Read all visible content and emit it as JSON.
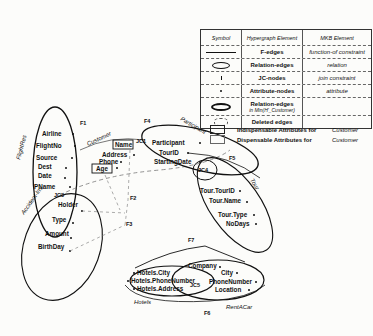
{
  "legend": {
    "headers": {
      "symbol": "Symbol",
      "hypergraph": "Hypergraph Element",
      "mkb": "MKB Element"
    },
    "rows": [
      {
        "symbol": "line-icon",
        "hypergraph": "F-edges",
        "mkb": "function-of constraint"
      },
      {
        "symbol": "ellipse-icon",
        "hypergraph": "Relation-edges",
        "mkb": "relation"
      },
      {
        "symbol": "tick-icon",
        "hypergraph": "JC-nodes",
        "mkb": "join constraint"
      },
      {
        "symbol": "dot-icon",
        "hypergraph": "Attribute-nodes",
        "mkb": "attribute"
      },
      {
        "symbol": "bold-ellipse-icon",
        "hypergraph": "Relation-edges",
        "hypergraph_sub": "in Min(H'_Customer)",
        "mkb": ""
      },
      {
        "symbol": "dashed-ellipse-icon",
        "hypergraph": "Deleted edges",
        "mkb": ""
      }
    ],
    "attributes": [
      {
        "label": "Indispensable Attributes for",
        "relation": "Customer"
      },
      {
        "label": "Dispensable Attributes for",
        "relation": "Customer"
      }
    ]
  },
  "relations": {
    "flightres": {
      "name": "FlightRes",
      "attrs": [
        "Airline",
        "FlightNo",
        "Source",
        "Dest",
        "Date",
        "PName"
      ]
    },
    "customer": {
      "name": "Customer",
      "attrs": [
        "Name",
        "Address",
        "Phone",
        "Age"
      ]
    },
    "participant": {
      "name": "Participant",
      "attrs": [
        "Participant",
        "TourID",
        "StartingDate"
      ]
    },
    "tour": {
      "name": "Tour",
      "attrs": [
        "Tour.TourID",
        "Tour.Name",
        "Tour.Type",
        "NoDays"
      ]
    },
    "accidentins": {
      "name": "Accident-Ins",
      "attrs": [
        "Holder",
        "Type",
        "Amount",
        "BirthDay"
      ]
    },
    "hotels": {
      "name": "Hotels",
      "attrs": [
        "Hotels.City",
        "Hotels.PhoneNumber",
        "Hotels.Address"
      ]
    },
    "rentacar": {
      "name": "RentACar",
      "attrs": [
        "Company",
        "City",
        "PhoneNumber",
        "Location"
      ]
    }
  },
  "join_nodes": {
    "jc1": "JC1",
    "jc3": "JC3",
    "jc4": "JC4",
    "jc5": "JC5"
  },
  "fedges": {
    "f1": "F1",
    "f2a": "F2",
    "f2b": "F2",
    "f3": "F3",
    "f4": "F4",
    "f5": "F5",
    "f6": "F6",
    "f7": "F7"
  }
}
